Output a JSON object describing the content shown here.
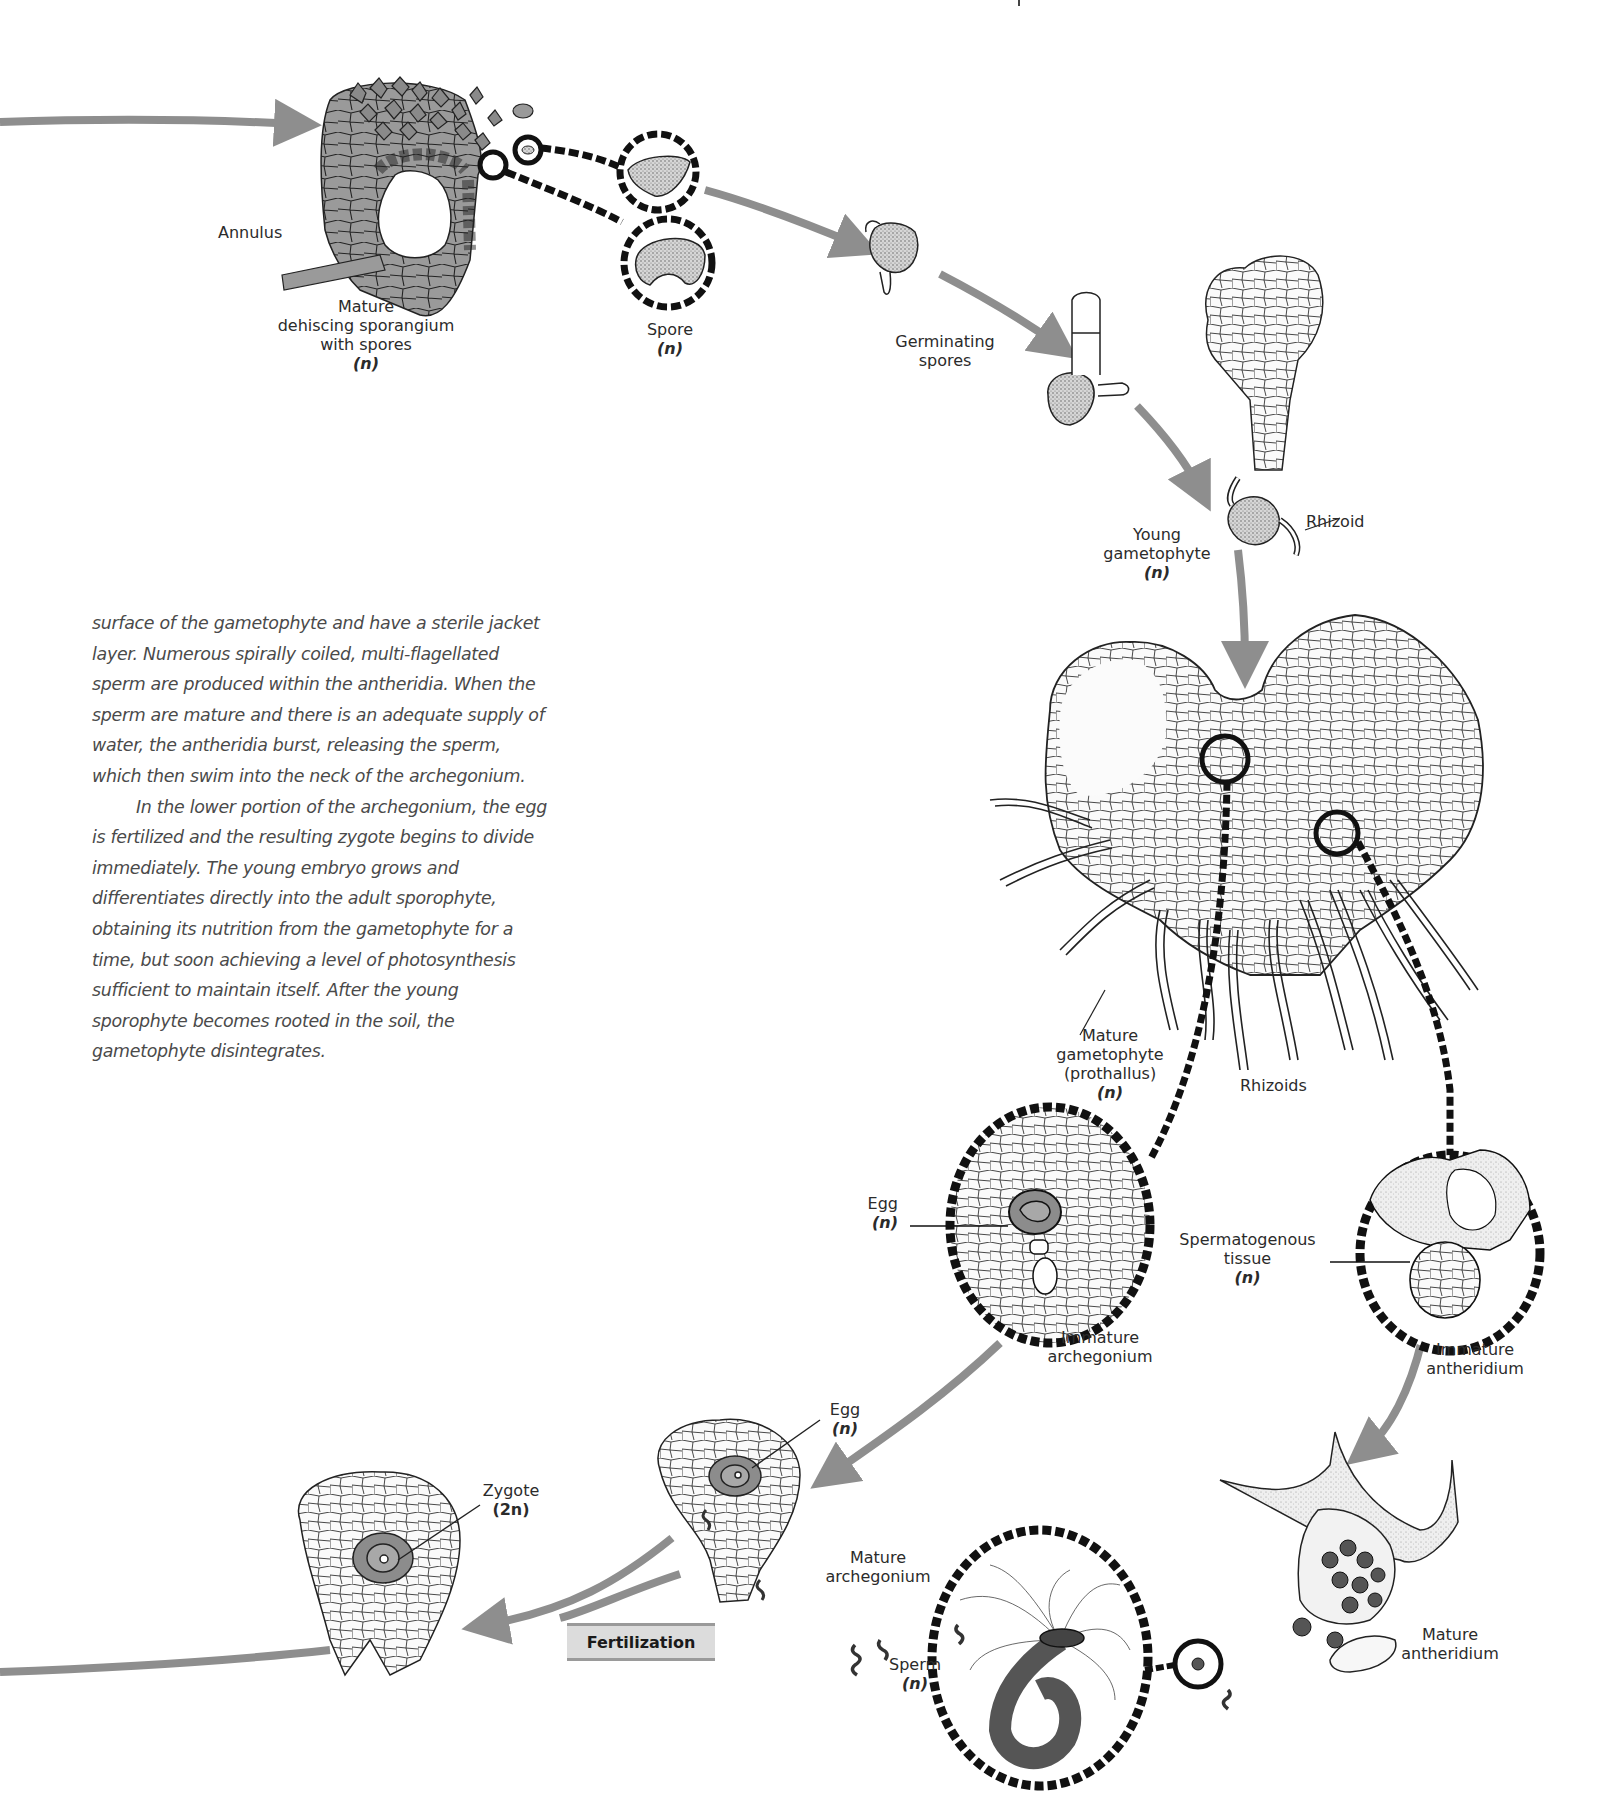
{
  "page": {
    "header_fragment": "|"
  },
  "diagram": {
    "colors": {
      "arrow": "#8e8e8e",
      "dashed_callout": "#111111",
      "tissue_fill": "#9a9a9a",
      "egg_fill": "#8c8c8c",
      "spore_fill": "#bdbdbd",
      "fertilization_box": "#dcdcdc"
    },
    "labels": {
      "annulus": "Annulus",
      "sporangium": {
        "line1": "Mature",
        "line2": "dehiscing sporangium",
        "line3": "with spores",
        "ploidy": "(n)"
      },
      "spore": {
        "line1": "Spore",
        "ploidy": "(n)"
      },
      "germinating": {
        "line1": "Germinating",
        "line2": "spores"
      },
      "rhizoid": "Rhizoid",
      "young_gametophyte": {
        "line1": "Young",
        "line2": "gametophyte",
        "ploidy": "(n)"
      },
      "mature_gametophyte": {
        "line1": "Mature",
        "line2": "gametophyte",
        "line3": "(prothallus)",
        "ploidy": "(n)"
      },
      "rhizoids": "Rhizoids",
      "egg_immature": {
        "line1": "Egg",
        "ploidy": "(n)"
      },
      "immature_archegonium": {
        "line1": "Immature",
        "line2": "archegonium"
      },
      "spermatogenous": {
        "line1": "Spermatogenous",
        "line2": "tissue",
        "ploidy": "(n)"
      },
      "immature_antheridium": {
        "line1": "Immature",
        "line2": "antheridium"
      },
      "egg_mature": {
        "line1": "Egg",
        "ploidy": "(n)"
      },
      "mature_archegonium": {
        "line1": "Mature",
        "line2": "archegonium"
      },
      "zygote": {
        "line1": "Zygote",
        "ploidy": "(2n)"
      },
      "fertilization": "Fertilization",
      "sperm": {
        "line1": "Sperm",
        "ploidy": "(n)"
      },
      "mature_antheridium": {
        "line1": "Mature",
        "line2": "antheridium"
      }
    }
  },
  "body_text": {
    "paragraph1": "surface of the gametophyte and have a sterile jacket layer. Numerous spirally coiled, multi-flagellated sperm are produced within the antheridia. When the sperm are mature and there is an adequate supply of water, the antheridia burst, releasing the sperm, which then swim into the neck of the archegonium.",
    "paragraph2": "In the lower portion of the archegonium, the egg is fertilized and the resulting zygote begins to divide immediately. The young embryo grows and differentiates directly into the adult sporophyte, obtaining its nutrition from the gametophyte for a time, but soon achieving a level of photosynthesis sufficient to maintain itself. After the young sporophyte becomes rooted in the soil, the gametophyte disintegrates."
  }
}
